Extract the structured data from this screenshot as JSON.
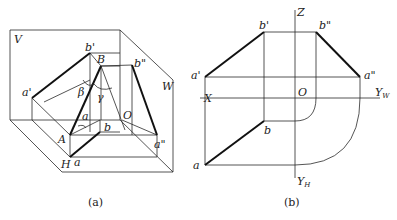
{
  "figure_a": {
    "caption": "(a)",
    "planes": {
      "V": "V",
      "W": "W",
      "H": "H"
    },
    "points": {
      "b_prime": "b'",
      "B": "B",
      "b_dprime": "b\"",
      "a_prime": "a'",
      "A": "A",
      "a": "a",
      "b": "b",
      "O": "O",
      "a_dprime": "a\""
    },
    "angles": {
      "alpha": "a",
      "beta": "β",
      "gamma": "γ"
    }
  },
  "figure_b": {
    "caption": "(b)",
    "axes": {
      "Z": "Z",
      "X": "X",
      "O": "O",
      "Y": "Y",
      "YW_sub": "W",
      "YH_sub": "H"
    },
    "points": {
      "b_prime": "b'",
      "b_dprime": "b\"",
      "a_prime": "a'",
      "a_dprime": "a\"",
      "b": "b",
      "a": "a"
    }
  }
}
